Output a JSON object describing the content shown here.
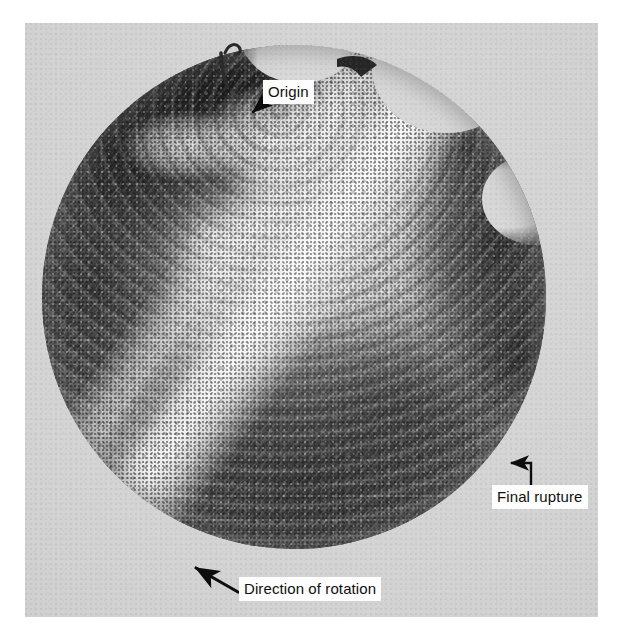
{
  "figure": {
    "kind": "photograph",
    "background_color": "#ffffff",
    "plate_color": "#d2d2d2",
    "ink_color": "#101010"
  },
  "annotations": [
    {
      "id": "origin",
      "label": "Origin",
      "arrow": "diagonal-down-left",
      "points_to": "upper-middle rim of the fracture face"
    },
    {
      "id": "final-rupture",
      "label": "Final rupture",
      "arrow": "elbow-up-then-left",
      "points_to": "dark zone at the right rim of the fracture face"
    },
    {
      "id": "direction-rotation",
      "label": "Direction of rotation",
      "arrow": "diagonal-up-left",
      "points_to": "lower-left rim of the fracture face"
    }
  ],
  "specimen": {
    "shape": "circle",
    "features": [
      "dark shear-lip wedge at upper left",
      "bright fatigue origin region at upper middle",
      "concentric beach marks radiating from the origin",
      "bright diagonal ridge band across the centre",
      "dark final-rupture zone at the right edge",
      "coarse halftone printing texture"
    ]
  }
}
